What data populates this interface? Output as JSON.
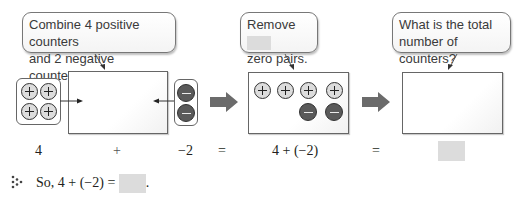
{
  "callouts": {
    "combine": {
      "line1": "Combine 4 positive counters",
      "line2": "and 2 negative counters."
    },
    "remove": {
      "line1": "Remove",
      "line2": "zero pairs."
    },
    "total": {
      "line1": "What is the total",
      "line2": "number of counters?"
    }
  },
  "groups": {
    "positive_counters": 4,
    "negative_counters": 2
  },
  "step2_box": {
    "positive_counters": 4,
    "negative_counters": 2
  },
  "equation_row": {
    "term1": "4",
    "plus": "+",
    "term2": "−2",
    "equals1": "=",
    "expression": "4 + (−2)",
    "equals2": "="
  },
  "summary": {
    "icon": "dotted-triangle-icon",
    "text": "So, 4 + (−2) =",
    "period": "."
  },
  "colors": {
    "positive_counter": "#dcdcdc",
    "negative_counter": "#5a5a5a",
    "arrow": "#6b6b6b",
    "blank": "#dcdcdc"
  }
}
